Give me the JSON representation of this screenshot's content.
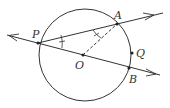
{
  "diagram": {
    "type": "geometry",
    "colors": {
      "stroke": "#333333",
      "background": "#ffffff"
    },
    "circle": {
      "center_label": "O",
      "cx": 85,
      "cy": 55,
      "r": 46
    },
    "points": [
      {
        "label": "P",
        "x": 38,
        "y": 43
      },
      {
        "label": "A",
        "x": 117,
        "y": 24
      },
      {
        "label": "O",
        "x": 83,
        "y": 55
      },
      {
        "label": "Q",
        "x": 132,
        "y": 53
      },
      {
        "label": "B",
        "x": 129,
        "y": 68
      }
    ],
    "labels": {
      "P": "P",
      "A": "A",
      "O": "O",
      "Q": "Q",
      "B": "B"
    }
  }
}
